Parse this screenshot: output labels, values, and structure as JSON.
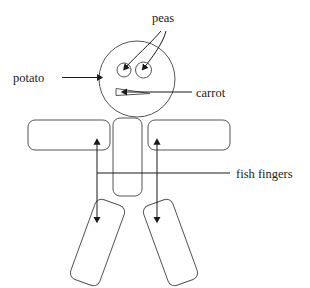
{
  "diagram": {
    "background_color": "#ffffff",
    "shape_stroke_color": "#555555",
    "line_color": "#1a1a1a",
    "labels": {
      "peas": "peas",
      "potato": "potato",
      "carrot": "carrot",
      "fish_fingers": "fish fingers"
    },
    "label_positions": {
      "peas": {
        "x": 152,
        "y": 22
      },
      "potato": {
        "x": 13,
        "y": 80
      },
      "carrot": {
        "x": 196,
        "y": 96
      },
      "fish_fingers": {
        "x": 236,
        "y": 178
      }
    },
    "parts": [
      {
        "name": "head-potato",
        "shape": "circle",
        "label": "potato",
        "cx": 137,
        "cy": 79,
        "r": 38
      },
      {
        "name": "eye-left-pea",
        "shape": "circle",
        "label": "peas",
        "cx": 124,
        "cy": 70,
        "r": 7
      },
      {
        "name": "eye-right-pea",
        "shape": "circle",
        "label": "peas",
        "cx": 143,
        "cy": 70,
        "r": 8
      },
      {
        "name": "mouth-carrot",
        "shape": "wedge",
        "label": "carrot"
      },
      {
        "name": "arm-left-fish-finger",
        "shape": "rounded-rect",
        "label": "fish fingers",
        "x": 28,
        "y": 120,
        "w": 82,
        "h": 30
      },
      {
        "name": "arm-right-fish-finger",
        "shape": "rounded-rect",
        "label": "fish fingers",
        "x": 148,
        "y": 120,
        "w": 82,
        "h": 30
      },
      {
        "name": "torso",
        "shape": "rounded-rect",
        "x": 113,
        "y": 118,
        "w": 29,
        "h": 78
      },
      {
        "name": "leg-left-fish-finger",
        "shape": "rounded-rect-rotated",
        "label": "fish fingers",
        "angle": -20
      },
      {
        "name": "leg-right-fish-finger",
        "shape": "rounded-rect-rotated",
        "label": "fish fingers",
        "angle": 20
      }
    ]
  }
}
